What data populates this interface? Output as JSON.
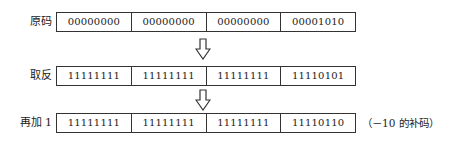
{
  "rows": [
    {
      "label": "原码",
      "cells": [
        "00000000",
        "00000000",
        "00000000",
        "00001010"
      ]
    },
    {
      "label": "取反",
      "cells": [
        "11111111",
        "11111111",
        "11111111",
        "11110101"
      ]
    },
    {
      "label": "再加 1",
      "cells": [
        "11111111",
        "11111111",
        "11111111",
        "11110110"
      ]
    }
  ],
  "arrows": [
    "down-arrow-icon",
    "down-arrow-icon"
  ],
  "note": "（－10 的补码）"
}
